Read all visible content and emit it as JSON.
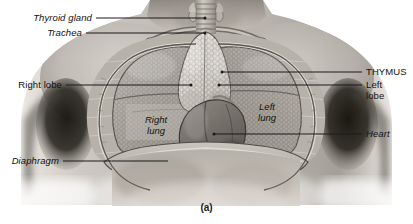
{
  "figure": {
    "caption": "(a)"
  },
  "labels": {
    "thyroid_gland": "Thyroid gland",
    "trachea": "Trachea",
    "right_lobe": "Right lobe",
    "diaphragm": "Diaphragm",
    "thymus": "THYMUS",
    "left_lobe_line1": "Left",
    "left_lobe_line2": "lobe",
    "heart": "Heart"
  },
  "in_figure_labels": {
    "right_lung_line1": "Right",
    "right_lung_line2": "lung",
    "left_lung_line1": "Left",
    "left_lung_line2": "lung"
  },
  "colors": {
    "leader_line": "#1a1a1a",
    "label_text": "#111111",
    "background": "#ffffff",
    "skin_light": "#d8d4ce",
    "skin_mid": "#a9a49d",
    "skin_shadow": "#4a4642",
    "lung_tone": "#9a958e",
    "thymus_tone": "#cfcac2",
    "heart_tone": "#6f6a65",
    "diaphragm_tone": "#bab5ad"
  }
}
